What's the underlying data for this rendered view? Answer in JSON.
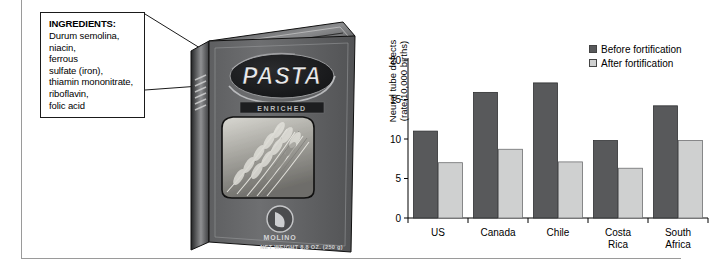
{
  "ingredients_callout": {
    "title": "INGREDIENTS:",
    "lines": [
      "Durum semolina,",
      "niacin,",
      "ferrous",
      "sulfate (iron),",
      "thiamin mononitrate,",
      "riboflavin,",
      "folic acid"
    ]
  },
  "pasta_box": {
    "brand": "PASTA",
    "banner": "ENRICHED",
    "maker": "MOLINO",
    "net_weight": "NET WEIGHT 8.8 OZ. (250 g)"
  },
  "chart_data": {
    "type": "bar",
    "title": "",
    "xlabel": "",
    "ylabel": "Neural tube defects (rate/10,000 births)",
    "ylabel_lines": [
      "Neural tube defects",
      "(rate/10,000 births)"
    ],
    "ylim": [
      0,
      20
    ],
    "yticks": [
      0,
      5,
      10,
      15,
      20
    ],
    "grid": false,
    "legend_position": "top-right",
    "categories": [
      "US",
      "Canada",
      "Chile",
      "Costa Rica",
      "South Africa"
    ],
    "category_lines": [
      [
        "US"
      ],
      [
        "Canada"
      ],
      [
        "Chile"
      ],
      [
        "Costa",
        "Rica"
      ],
      [
        "South",
        "Africa"
      ]
    ],
    "series": [
      {
        "name": "Before fortification",
        "color": "#58595b",
        "values": [
          11.0,
          15.9,
          17.1,
          9.8,
          14.2
        ]
      },
      {
        "name": "After fortification",
        "color": "#cfd0d0",
        "values": [
          7.0,
          8.7,
          7.1,
          6.3,
          9.8
        ]
      }
    ]
  }
}
